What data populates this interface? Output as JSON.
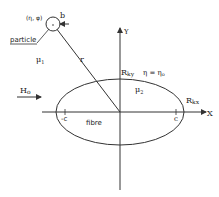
{
  "diagram": {
    "particle": {
      "coord_label": "(η, φ)",
      "radius_label": "b",
      "name_label": "particle"
    },
    "medium_outer": "μ",
    "medium_outer_sub": "1",
    "medium_inner": "μ",
    "medium_inner_sub": "2",
    "field": {
      "label": "H",
      "sub": "o"
    },
    "distance_label": "r",
    "axes": {
      "x": "X",
      "y": "Y"
    },
    "fibre_label": "fibre",
    "semi_axis_y": {
      "label": "R",
      "sub": "ky"
    },
    "semi_axis_x": {
      "label": "R",
      "sub": "kx"
    },
    "boundary": {
      "text": "η = η",
      "sub": "o"
    },
    "focus_left": "-c",
    "focus_right": "c"
  },
  "colors": {
    "line": "#333333",
    "text": "#222222",
    "background": "#ffffff"
  }
}
